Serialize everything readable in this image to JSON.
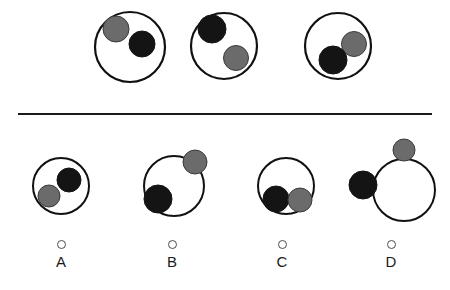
{
  "puzzle": {
    "title": "Circle and ball arrangement analogy puzzle",
    "divider": {
      "name": "horizontal-divider",
      "x1": 18,
      "y1": 114,
      "x2": 432,
      "y2": 114,
      "color": "#1a1a1a",
      "thickness": 2.2
    },
    "colors": {
      "outline": "#111111",
      "black_ball": "#141414",
      "gray_ball": "#6b6b6b",
      "gray_ball_outline": "#3a3a3a",
      "background": "#ffffff",
      "radio_outline": "#4c4c4c",
      "label_text": "#1a1a1a"
    },
    "prompt_row": {
      "name": "prompt-sequence",
      "count": 3,
      "figures": [
        {
          "id": "prompt-figure-1",
          "host_circle": {
            "cx": 130,
            "cy": 47,
            "r": 35,
            "stroke": 2.2
          },
          "balls": [
            {
              "id": "gray-ball",
              "color": "gray",
              "cx": 116,
              "cy": 29,
              "r": 13
            },
            {
              "id": "black-ball",
              "color": "black",
              "cx": 142,
              "cy": 44,
              "r": 13
            }
          ]
        },
        {
          "id": "prompt-figure-2",
          "host_circle": {
            "cx": 224,
            "cy": 46,
            "r": 33,
            "stroke": 2.2
          },
          "balls": [
            {
              "id": "black-ball",
              "color": "black",
              "cx": 212,
              "cy": 29,
              "r": 14
            },
            {
              "id": "gray-ball",
              "color": "gray",
              "cx": 236,
              "cy": 58,
              "r": 12.5
            }
          ]
        },
        {
          "id": "prompt-figure-3",
          "host_circle": {
            "cx": 338,
            "cy": 46,
            "r": 33,
            "stroke": 2.2
          },
          "balls": [
            {
              "id": "gray-ball",
              "color": "gray",
              "cx": 354,
              "cy": 44,
              "r": 12.5
            },
            {
              "id": "black-ball",
              "color": "black",
              "cx": 333,
              "cy": 60,
              "r": 14
            }
          ]
        }
      ]
    },
    "answer_row": {
      "name": "answer-options",
      "count": 4,
      "options": [
        {
          "id": "option-a",
          "letter": "A",
          "label_x": 31,
          "selected": false,
          "host_circle": {
            "cx": 61,
            "cy": 186,
            "r": 28,
            "stroke": 2.0
          },
          "balls": [
            {
              "id": "black-ball",
              "color": "black",
              "cx": 69,
              "cy": 180,
              "r": 12
            },
            {
              "id": "gray-ball",
              "color": "gray",
              "cx": 49,
              "cy": 196,
              "r": 11
            }
          ]
        },
        {
          "id": "option-b",
          "letter": "B",
          "label_x": 142,
          "selected": false,
          "host_circle": {
            "cx": 174,
            "cy": 186,
            "r": 30,
            "stroke": 2.0
          },
          "balls": [
            {
              "id": "gray-ball",
              "color": "gray",
              "cx": 195,
              "cy": 162,
              "r": 12
            },
            {
              "id": "black-ball",
              "color": "black",
              "cx": 158,
              "cy": 199,
              "r": 14
            }
          ]
        },
        {
          "id": "option-c",
          "letter": "C",
          "label_x": 252,
          "selected": false,
          "host_circle": {
            "cx": 286,
            "cy": 186,
            "r": 28,
            "stroke": 2.0
          },
          "balls": [
            {
              "id": "black-ball",
              "color": "black",
              "cx": 276,
              "cy": 199,
              "r": 13
            },
            {
              "id": "gray-ball",
              "color": "gray",
              "cx": 300,
              "cy": 200,
              "r": 12
            }
          ]
        },
        {
          "id": "option-d",
          "letter": "D",
          "label_x": 361,
          "selected": false,
          "host_circle": {
            "cx": 404,
            "cy": 190,
            "r": 31,
            "stroke": 2.0
          },
          "balls": [
            {
              "id": "gray-ball",
              "color": "gray",
              "cx": 404,
              "cy": 150,
              "r": 11
            },
            {
              "id": "black-ball",
              "color": "black",
              "cx": 363,
              "cy": 185,
              "r": 14
            }
          ]
        }
      ]
    }
  }
}
